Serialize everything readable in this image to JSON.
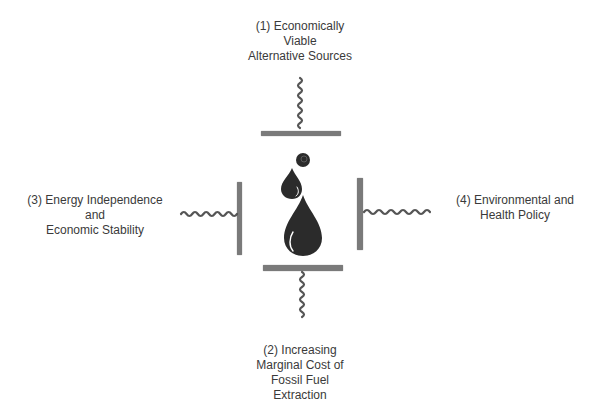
{
  "diagram": {
    "type": "force-diagram",
    "center": {
      "icon": "oil-drops-icon",
      "description": "Oil drops compressed by four forces"
    },
    "forces": [
      {
        "id": "top",
        "position": "top",
        "number": "(1)",
        "lines": [
          "(1) Economically",
          "Viable",
          "Alternative Sources"
        ]
      },
      {
        "id": "bottom",
        "position": "bottom",
        "number": "(2)",
        "lines": [
          "(2) Increasing",
          "Marginal Cost of",
          "Fossil Fuel",
          "Extraction"
        ]
      },
      {
        "id": "left",
        "position": "left",
        "number": "(3)",
        "lines": [
          "(3) Energy Independence",
          "and",
          "Economic Stability"
        ]
      },
      {
        "id": "right",
        "position": "right",
        "number": "(4)",
        "lines": [
          "(4) Environmental and",
          "Health Policy"
        ]
      }
    ],
    "colors": {
      "bar": "#7a7a7a",
      "spring": "#555555",
      "drop": "#2b2b2b",
      "text": "#3a3a3a",
      "background": "#ffffff"
    }
  }
}
